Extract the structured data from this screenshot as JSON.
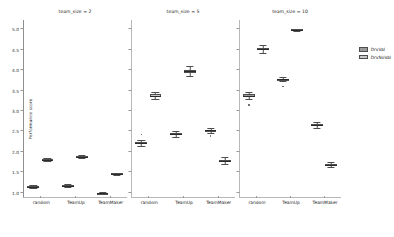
{
  "figure": {
    "ylabel": "Performance score",
    "legend": {
      "position": "right",
      "entries": [
        {
          "label": "DrvVal",
          "color": "#9a9a9a"
        },
        {
          "label": "DrvNoVal",
          "color": "#c8c8c8"
        }
      ]
    }
  },
  "chart_data": {
    "type": "box",
    "title": "",
    "xlabel": "",
    "ylabel": "Performance score",
    "ylim": [
      0.85,
      5.2
    ],
    "yticks": [
      1.0,
      1.5,
      2.0,
      2.5,
      3.0,
      3.5,
      4.0,
      4.5,
      5.0
    ],
    "ytick_labels": [
      "1.0",
      "1.5",
      "2.0",
      "2.5",
      "3.0",
      "3.5",
      "4.0",
      "4.5",
      "5.0"
    ],
    "grid": false,
    "legend_position": "right",
    "facet_variable": "team_size",
    "categories": [
      "random",
      "TeamUp",
      "TeamMaker"
    ],
    "hues": [
      "DrvVal",
      "DrvNoVal"
    ],
    "colors": {
      "DrvVal": "#9a9a9a",
      "DrvNoVal": "#c8c8c8"
    },
    "panels": [
      {
        "title": "team_size = 2",
        "boxes": [
          {
            "category": "random",
            "hue": "DrvVal",
            "whislo": 1.1,
            "q1": 1.12,
            "med": 1.13,
            "q3": 1.14,
            "whishi": 1.16,
            "fliers": []
          },
          {
            "category": "random",
            "hue": "DrvNoVal",
            "whislo": 1.75,
            "q1": 1.78,
            "med": 1.79,
            "q3": 1.8,
            "whishi": 1.82,
            "fliers": []
          },
          {
            "category": "TeamUp",
            "hue": "DrvVal",
            "whislo": 1.13,
            "q1": 1.14,
            "med": 1.15,
            "q3": 1.16,
            "whishi": 1.18,
            "fliers": []
          },
          {
            "category": "TeamUp",
            "hue": "DrvNoVal",
            "whislo": 1.82,
            "q1": 1.84,
            "med": 1.85,
            "q3": 1.87,
            "whishi": 1.89,
            "fliers": []
          },
          {
            "category": "TeamMaker",
            "hue": "DrvVal",
            "whislo": 0.95,
            "q1": 0.96,
            "med": 0.97,
            "q3": 0.98,
            "whishi": 1.0,
            "fliers": []
          },
          {
            "category": "TeamMaker",
            "hue": "DrvNoVal",
            "whislo": 1.42,
            "q1": 1.43,
            "med": 1.44,
            "q3": 1.45,
            "whishi": 1.47,
            "fliers": []
          }
        ]
      },
      {
        "title": "team_size = 5",
        "boxes": [
          {
            "category": "random",
            "hue": "DrvVal",
            "whislo": 2.13,
            "q1": 2.17,
            "med": 2.2,
            "q3": 2.23,
            "whishi": 2.27,
            "fliers": [
              2.4
            ]
          },
          {
            "category": "random",
            "hue": "DrvNoVal",
            "whislo": 3.26,
            "q1": 3.31,
            "med": 3.34,
            "q3": 3.38,
            "whishi": 3.44,
            "fliers": []
          },
          {
            "category": "TeamUp",
            "hue": "DrvVal",
            "whislo": 2.34,
            "q1": 2.38,
            "med": 2.41,
            "q3": 2.44,
            "whishi": 2.48,
            "fliers": []
          },
          {
            "category": "TeamUp",
            "hue": "DrvNoVal",
            "whislo": 3.84,
            "q1": 3.91,
            "med": 3.95,
            "q3": 3.99,
            "whishi": 4.08,
            "fliers": []
          },
          {
            "category": "TeamMaker",
            "hue": "DrvVal",
            "whislo": 2.44,
            "q1": 2.48,
            "med": 2.5,
            "q3": 2.52,
            "whishi": 2.55,
            "fliers": [
              2.38,
              2.35
            ]
          },
          {
            "category": "TeamMaker",
            "hue": "DrvNoVal",
            "whislo": 1.68,
            "q1": 1.73,
            "med": 1.76,
            "q3": 1.79,
            "whishi": 1.85,
            "fliers": []
          }
        ]
      },
      {
        "title": "team_size = 10",
        "boxes": [
          {
            "category": "random",
            "hue": "DrvVal",
            "whislo": 3.26,
            "q1": 3.31,
            "med": 3.34,
            "q3": 3.38,
            "whishi": 3.44,
            "fliers": [
              3.12
            ]
          },
          {
            "category": "random",
            "hue": "DrvNoVal",
            "whislo": 4.4,
            "q1": 4.46,
            "med": 4.49,
            "q3": 4.52,
            "whishi": 4.6,
            "fliers": []
          },
          {
            "category": "TeamUp",
            "hue": "DrvVal",
            "whislo": 3.7,
            "q1": 3.73,
            "med": 3.75,
            "q3": 3.77,
            "whishi": 3.8,
            "fliers": [
              3.57
            ]
          },
          {
            "category": "TeamUp",
            "hue": "DrvNoVal",
            "whislo": 4.92,
            "q1": 4.95,
            "med": 4.96,
            "q3": 4.97,
            "whishi": 4.99,
            "fliers": []
          },
          {
            "category": "TeamMaker",
            "hue": "DrvVal",
            "whislo": 2.55,
            "q1": 2.6,
            "med": 2.63,
            "q3": 2.66,
            "whishi": 2.7,
            "fliers": []
          },
          {
            "category": "TeamMaker",
            "hue": "DrvNoVal",
            "whislo": 1.6,
            "q1": 1.64,
            "med": 1.66,
            "q3": 1.69,
            "whishi": 1.73,
            "fliers": []
          }
        ]
      }
    ]
  }
}
